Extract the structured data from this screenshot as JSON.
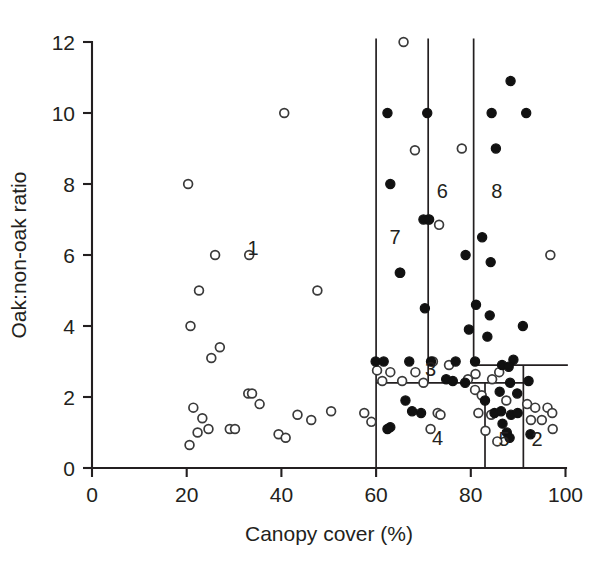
{
  "chart_data": {
    "type": "scatter",
    "title": "",
    "xlabel": "Canopy cover (%)",
    "ylabel": "Oak:non-oak ratio",
    "xlim": [
      0,
      100
    ],
    "ylim": [
      0,
      12
    ],
    "xticks": [
      0,
      20,
      40,
      60,
      80,
      100
    ],
    "yticks": [
      0,
      2,
      4,
      6,
      8,
      10,
      12
    ],
    "xtick_labels": [
      "0",
      "20",
      "40",
      "60",
      "80",
      "100"
    ],
    "ytick_labels": [
      "0",
      "2",
      "4",
      "6",
      "8",
      "10",
      "12"
    ],
    "grid": false,
    "legend": "none",
    "series": [
      {
        "name": "open-circle",
        "marker": "open circle",
        "points": [
          [
            20.3,
            8.0
          ],
          [
            40.6,
            10.0
          ],
          [
            26.0,
            6.0
          ],
          [
            33.2,
            6.0
          ],
          [
            22.6,
            5.0
          ],
          [
            47.6,
            5.0
          ],
          [
            20.8,
            4.0
          ],
          [
            27.0,
            3.4
          ],
          [
            25.2,
            3.1
          ],
          [
            33.0,
            2.1
          ],
          [
            33.8,
            2.1
          ],
          [
            35.4,
            1.8
          ],
          [
            21.4,
            1.7
          ],
          [
            43.4,
            1.5
          ],
          [
            46.3,
            1.35
          ],
          [
            23.3,
            1.4
          ],
          [
            24.6,
            1.1
          ],
          [
            22.3,
            1.0
          ],
          [
            29.1,
            1.1
          ],
          [
            30.2,
            1.1
          ],
          [
            39.4,
            0.95
          ],
          [
            40.9,
            0.85
          ],
          [
            20.6,
            0.65
          ],
          [
            50.5,
            1.6
          ],
          [
            57.5,
            1.55
          ],
          [
            59.0,
            1.3
          ],
          [
            65.8,
            12.0
          ],
          [
            78.1,
            9.0
          ],
          [
            68.2,
            8.95
          ],
          [
            71.0,
            7.0
          ],
          [
            73.3,
            6.85
          ],
          [
            96.8,
            6.0
          ],
          [
            65.0,
            5.5
          ],
          [
            72.0,
            3.0
          ],
          [
            60.2,
            2.75
          ],
          [
            63.0,
            2.7
          ],
          [
            68.3,
            2.7
          ],
          [
            75.4,
            2.9
          ],
          [
            81.0,
            2.65
          ],
          [
            86.0,
            2.7
          ],
          [
            61.3,
            2.45
          ],
          [
            65.5,
            2.45
          ],
          [
            70.0,
            2.4
          ],
          [
            79.4,
            2.5
          ],
          [
            84.5,
            2.5
          ],
          [
            80.9,
            2.2
          ],
          [
            82.3,
            2.05
          ],
          [
            87.5,
            1.9
          ],
          [
            91.9,
            1.8
          ],
          [
            93.6,
            1.7
          ],
          [
            96.2,
            1.7
          ],
          [
            73.0,
            1.55
          ],
          [
            73.6,
            1.5
          ],
          [
            81.6,
            1.55
          ],
          [
            84.3,
            1.5
          ],
          [
            92.7,
            1.35
          ],
          [
            95.0,
            1.35
          ],
          [
            97.2,
            1.55
          ],
          [
            83.1,
            1.05
          ],
          [
            71.5,
            1.1
          ],
          [
            97.3,
            1.1
          ],
          [
            85.6,
            0.75
          ]
        ]
      },
      {
        "name": "filled-circle",
        "marker": "filled circle",
        "points": [
          [
            62.4,
            10.0
          ],
          [
            70.8,
            10.0
          ],
          [
            88.4,
            10.9
          ],
          [
            84.4,
            10.0
          ],
          [
            91.7,
            10.0
          ],
          [
            63.0,
            8.0
          ],
          [
            85.3,
            9.0
          ],
          [
            70.0,
            7.0
          ],
          [
            71.2,
            7.0
          ],
          [
            65.1,
            5.5
          ],
          [
            82.4,
            6.5
          ],
          [
            70.3,
            4.5
          ],
          [
            78.9,
            6.0
          ],
          [
            84.2,
            5.8
          ],
          [
            81.1,
            4.6
          ],
          [
            84.0,
            4.3
          ],
          [
            79.6,
            3.9
          ],
          [
            83.5,
            3.7
          ],
          [
            91.0,
            4.0
          ],
          [
            59.9,
            3.0
          ],
          [
            61.6,
            3.0
          ],
          [
            67.0,
            3.0
          ],
          [
            71.6,
            3.0
          ],
          [
            76.8,
            3.0
          ],
          [
            80.9,
            3.0
          ],
          [
            86.6,
            2.9
          ],
          [
            89.0,
            3.05
          ],
          [
            74.8,
            2.5
          ],
          [
            76.2,
            2.45
          ],
          [
            78.8,
            2.4
          ],
          [
            88.3,
            2.4
          ],
          [
            92.2,
            2.45
          ],
          [
            86.1,
            2.15
          ],
          [
            89.8,
            2.1
          ],
          [
            66.2,
            1.9
          ],
          [
            83.0,
            1.9
          ],
          [
            69.5,
            1.55
          ],
          [
            85.0,
            1.55
          ],
          [
            86.4,
            1.6
          ],
          [
            88.5,
            1.5
          ],
          [
            63.0,
            1.15
          ],
          [
            62.4,
            1.1
          ],
          [
            86.7,
            1.25
          ],
          [
            87.6,
            1.0
          ],
          [
            88.2,
            0.85
          ],
          [
            67.6,
            1.6
          ],
          [
            89.9,
            1.55
          ],
          [
            88.0,
            2.85
          ],
          [
            92.6,
            0.95
          ]
        ]
      }
    ],
    "regions": [
      {
        "label": "1",
        "x": 34.0,
        "y": 6.0
      },
      {
        "label": "7",
        "x": 64.0,
        "y": 6.3
      },
      {
        "label": "6",
        "x": 74.0,
        "y": 7.6
      },
      {
        "label": "8",
        "x": 85.5,
        "y": 7.6
      },
      {
        "label": "3",
        "x": 71.5,
        "y": 2.6
      },
      {
        "label": "4",
        "x": 73.0,
        "y": 0.65
      },
      {
        "label": "5",
        "x": 87.0,
        "y": 0.62
      },
      {
        "label": "2",
        "x": 94.0,
        "y": 0.62
      }
    ],
    "region_lines": {
      "verticals": [
        {
          "x": 60.0,
          "y0": 0.0,
          "y1": 12.1
        },
        {
          "x": 71.0,
          "y0": 2.4,
          "y1": 12.1
        },
        {
          "x": 80.6,
          "y0": 2.9,
          "y1": 12.1
        },
        {
          "x": 91.1,
          "y0": 0.0,
          "y1": 2.9
        },
        {
          "x": 83.0,
          "y0": 0.0,
          "y1": 2.4
        }
      ],
      "horizontals": [
        {
          "y": 2.9,
          "x0": 80.6,
          "x1": 100.5
        },
        {
          "y": 2.4,
          "x0": 60.0,
          "x1": 91.1
        }
      ]
    }
  }
}
